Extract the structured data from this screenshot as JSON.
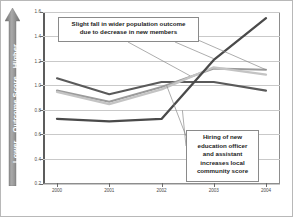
{
  "chart_data": {
    "type": "line",
    "title": "",
    "xlabel": "",
    "ylabel": "Outcome Score",
    "ylabel_low": "Lower",
    "ylabel_high": "Higher",
    "categories": [
      "2000",
      "2001",
      "2002",
      "2003",
      "2004"
    ],
    "x": [
      2000,
      2001,
      2002,
      2003,
      2004
    ],
    "ylim": [
      0.2,
      1.6
    ],
    "xlim": [
      2000,
      2004
    ],
    "yticks": [
      0.2,
      0.4,
      0.6,
      0.8,
      1.0,
      1.2,
      1.4,
      1.6
    ],
    "ytick_labels": [
      "0.2",
      "0.4",
      "0.6",
      "0.8",
      "1.0",
      "1.2",
      "1.4",
      "1.6"
    ],
    "grid": true,
    "legend": false,
    "legend_position": "none",
    "series": [
      {
        "name": "wider population outcome",
        "color": "#5a5a5a",
        "width": 2.1,
        "values": [
          1.06,
          0.93,
          1.03,
          1.03,
          0.96
        ]
      },
      {
        "name": "member outcome",
        "color": "#9b9b9b",
        "width": 2.1,
        "values": [
          0.96,
          0.87,
          0.99,
          1.14,
          1.13
        ]
      },
      {
        "name": "new member outcome",
        "color": "#c4c4c4",
        "width": 2.3,
        "values": [
          0.95,
          0.85,
          0.97,
          1.15,
          1.09
        ]
      },
      {
        "name": "local community score",
        "color": "#4a4a4a",
        "width": 2.3,
        "values": [
          0.73,
          0.71,
          0.73,
          1.21,
          1.55
        ]
      }
    ],
    "annotations": [
      {
        "id": "annotation-population",
        "text": "Slight fall in wider population outcome due to decrease in new members",
        "lines": [
          "Slight fall in wider population outcome",
          "due to decrease in new members"
        ],
        "points_to": [
          [
            2002.55,
            1.08
          ],
          [
            2003.0,
            1.22
          ],
          [
            2004.0,
            1.13
          ]
        ]
      },
      {
        "id": "annotation-hiring",
        "text": "Hiring of new education officer and assistant increases local community score",
        "lines": [
          "Hiring of new",
          "education officer",
          "and assistant",
          "increases local",
          "community score"
        ],
        "points_to": [
          [
            2002.1,
            1.0
          ],
          [
            2002.4,
            0.8
          ]
        ]
      }
    ]
  },
  "colors": {
    "axis": "#5c5c5c",
    "grid": "#c9c9c9",
    "frame": "#8d8d8d",
    "callout_border": "#8a8a8a",
    "arrow": "#8d8d8d",
    "arrow_text": "#ffffff",
    "background": "#ffffff"
  }
}
